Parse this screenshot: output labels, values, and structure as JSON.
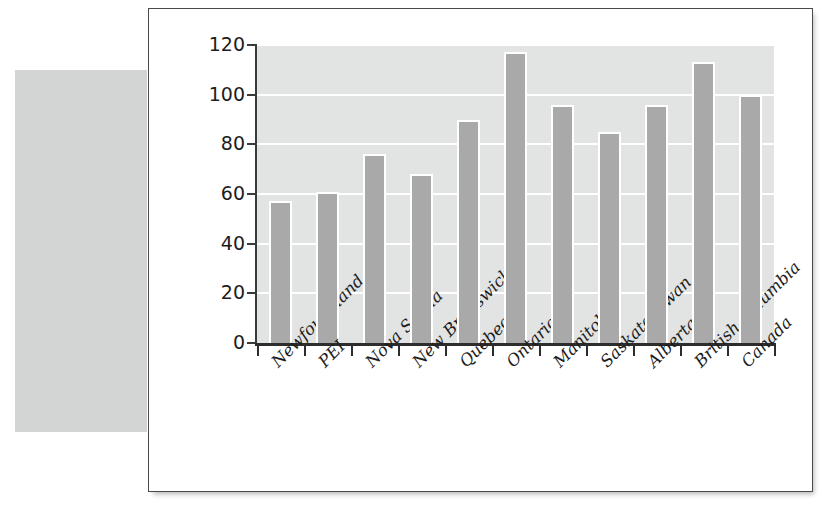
{
  "figure": {
    "panel_background": "#ffffff",
    "panel_border_color": "#4a4a4a",
    "side_block_color": "#d3d4d4"
  },
  "chart_data": {
    "type": "bar",
    "title": "",
    "subtitle": "",
    "xlabel": "",
    "ylabel": "",
    "ylim": [
      0,
      120
    ],
    "yticks": [
      0,
      20,
      40,
      60,
      80,
      100,
      120
    ],
    "ytick_labels": [
      "0",
      "20",
      "40",
      "60",
      "80",
      "100",
      "120"
    ],
    "grid": true,
    "grid_orientation": "horizontal",
    "grid_color": "#ffffff",
    "plot_background": "#e2e3e3",
    "bar_color": "#a9a9a9",
    "bar_edge_color": "#ffffff",
    "legend": null,
    "legend_position": "none",
    "categories": [
      "Newfoundland",
      "PEI",
      "Nova Scotia",
      "New Brunswick",
      "Quebec",
      "Ontario",
      "Manitoba",
      "Saskatchewan",
      "Alberta",
      "British Columbia",
      "Canada"
    ],
    "values": [
      57,
      61,
      76,
      68,
      90,
      117,
      96,
      85,
      96,
      113,
      100
    ]
  }
}
